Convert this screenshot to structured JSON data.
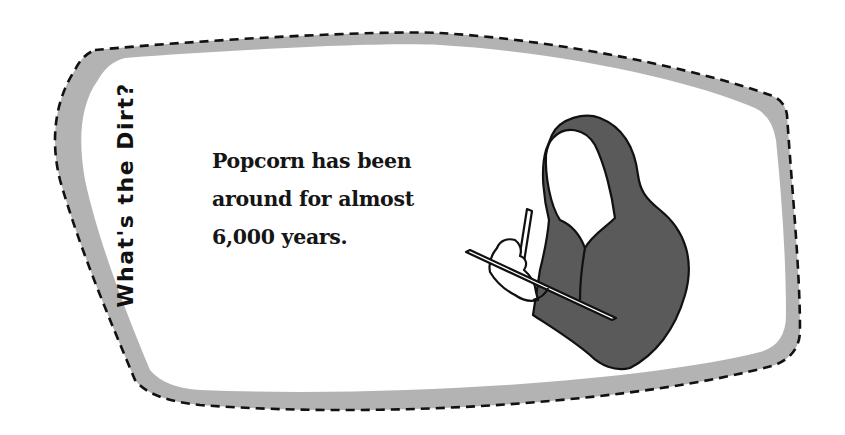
{
  "card": {
    "side_title": "What's the Dirt?",
    "fact_lines": [
      "Popcorn has been",
      "around for almost",
      "6,000 years."
    ],
    "illustration": "hooded-figure-writing-on-clipboard-icon"
  },
  "colors": {
    "background": "#ffffff",
    "frame_band": "#b3b3b3",
    "frame_dash": "#111111",
    "hood_fill": "#5a5a5a",
    "outline": "#111111",
    "text": "#151515"
  }
}
